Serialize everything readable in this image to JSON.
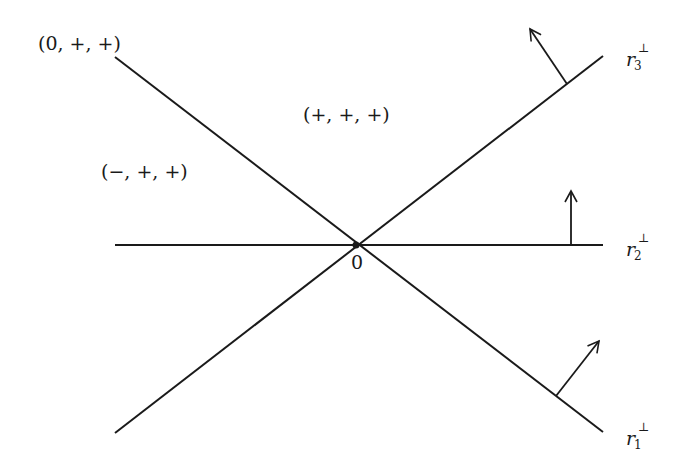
{
  "diagram": {
    "type": "hyperplane-arrangement",
    "origin_label": "0",
    "regions": [
      {
        "id": "zero-plus-plus",
        "label": "(0, +, +)"
      },
      {
        "id": "plus-plus-plus",
        "label": "(+, +, +)"
      },
      {
        "id": "minus-plus-plus",
        "label": "(−, +, +)"
      }
    ],
    "hyperplanes": [
      {
        "id": "r1",
        "name": "r",
        "subscript": "1",
        "superscript": "⊥"
      },
      {
        "id": "r2",
        "name": "r",
        "subscript": "2",
        "superscript": "⊥"
      },
      {
        "id": "r3",
        "name": "r",
        "subscript": "3",
        "superscript": "⊥"
      }
    ],
    "colors": {
      "line": "#1a1a1a",
      "background": "#ffffff"
    }
  }
}
